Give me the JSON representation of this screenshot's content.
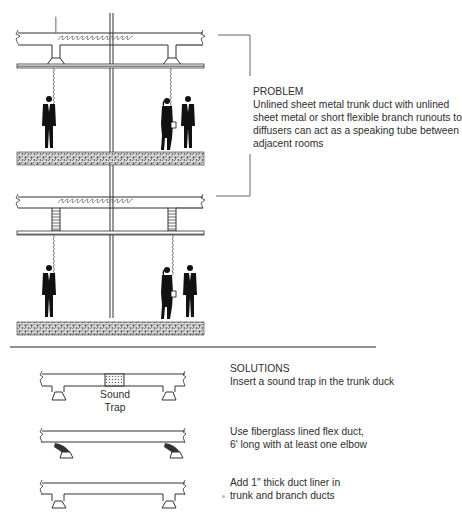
{
  "problem": {
    "heading": "PROBLEM",
    "lines": [
      "Unlined sheet metal trunk duct with unlined",
      "sheet metal or short flexible branch runouts to",
      "diffusers can act as a speaking tube between",
      "adjacent rooms"
    ]
  },
  "solutions": {
    "heading": "SOLUTIONS",
    "items": [
      {
        "lines": [
          "Insert a sound trap in the trunk duck"
        ],
        "diagram_label": [
          "Sound",
          "Trap"
        ]
      },
      {
        "lines": [
          "Use fiberglass lined flex duct,",
          "6' long with at least one elbow"
        ]
      },
      {
        "lines": [
          "Add 1\" thick duct liner in",
          "trunk and branch ducts"
        ]
      }
    ]
  },
  "colors": {
    "line": "#3a3a3a",
    "figure": "#111111",
    "hatch": "#555555",
    "background": "#ffffff"
  }
}
